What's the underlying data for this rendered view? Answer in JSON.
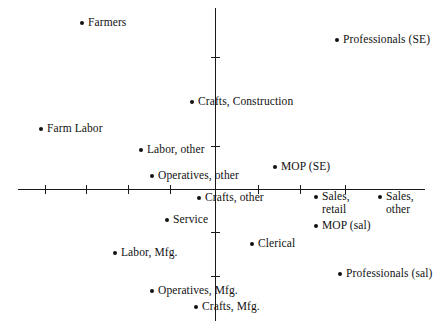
{
  "chart_data": {
    "type": "scatter",
    "title": "",
    "subtitle": "",
    "xlabel": "",
    "ylabel": "",
    "grid": false,
    "legend": "none",
    "axes": {
      "origin_px": {
        "x": 215,
        "y": 189
      },
      "x_axis_px": {
        "start": 18,
        "end": 425,
        "y": 189
      },
      "y_axis_px": {
        "top": 8,
        "bottom": 321,
        "x": 215
      },
      "x_ticks_px": [
        45,
        86,
        128,
        170,
        258,
        300,
        345
      ],
      "y_ticks_px": [
        57,
        146,
        232,
        276
      ],
      "tick_labels_x": [],
      "tick_labels_y": []
    },
    "points": [
      {
        "label": "Farmers",
        "x_px": 82,
        "y_px": 23,
        "side": "right"
      },
      {
        "label": "Professionals (SE)",
        "x_px": 337,
        "y_px": 40,
        "side": "right"
      },
      {
        "label": "Crafts, Construction",
        "x_px": 192,
        "y_px": 102,
        "side": "right"
      },
      {
        "label": "Farm Labor",
        "x_px": 41,
        "y_px": 129,
        "side": "right"
      },
      {
        "label": "Labor, other",
        "x_px": 141,
        "y_px": 150,
        "side": "right"
      },
      {
        "label": "MOP (SE)",
        "x_px": 275,
        "y_px": 167,
        "side": "right"
      },
      {
        "label": "Operatives, other",
        "x_px": 152,
        "y_px": 176,
        "side": "right"
      },
      {
        "label": "Crafts, other",
        "x_px": 199,
        "y_px": 198,
        "side": "right"
      },
      {
        "label": "Sales,\nretail",
        "x_px": 316,
        "y_px": 197,
        "side": "right"
      },
      {
        "label": "Sales,\nother",
        "x_px": 380,
        "y_px": 197,
        "side": "right"
      },
      {
        "label": "Service",
        "x_px": 167,
        "y_px": 220,
        "side": "right"
      },
      {
        "label": "MOP (sal)",
        "x_px": 316,
        "y_px": 226,
        "side": "right"
      },
      {
        "label": "Clerical",
        "x_px": 252,
        "y_px": 244,
        "side": "right"
      },
      {
        "label": "Labor, Mfg.",
        "x_px": 115,
        "y_px": 253,
        "side": "right"
      },
      {
        "label": "Professionals (sal)",
        "x_px": 340,
        "y_px": 274,
        "side": "right"
      },
      {
        "label": "Operatives, Mfg.",
        "x_px": 152,
        "y_px": 291,
        "side": "right"
      },
      {
        "label": "Crafts, Mfg.",
        "x_px": 196,
        "y_px": 307,
        "side": "right"
      }
    ]
  }
}
